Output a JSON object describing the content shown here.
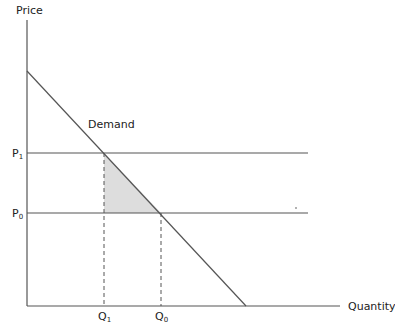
{
  "diagram": {
    "type": "supply-demand",
    "axes": {
      "y_label": "Price",
      "x_label": "Quantity"
    },
    "curve_label": "Demand",
    "price_levels": [
      {
        "label": "P",
        "sub": "1"
      },
      {
        "label": "P",
        "sub": "0"
      }
    ],
    "quantity_levels": [
      {
        "label": "Q",
        "sub": "1"
      },
      {
        "label": "Q",
        "sub": "0"
      }
    ],
    "colors": {
      "line": "#555555",
      "shaded_area": "#dddddd",
      "text": "#222222"
    }
  }
}
